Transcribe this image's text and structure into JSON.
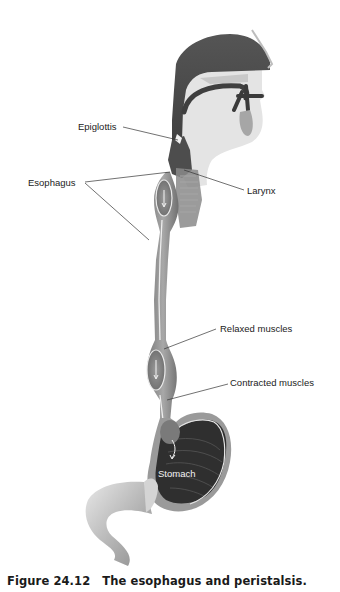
{
  "figure": {
    "labels": {
      "epiglottis": "Epiglottis",
      "esophagus": "Esophagus",
      "larynx": "Larynx",
      "relaxed_muscles": "Relaxed muscles",
      "contracted_muscles": "Contracted muscles",
      "stomach": "Stomach"
    },
    "caption": {
      "number": "Figure 24.12",
      "title": "The esophagus and peristalsis."
    }
  },
  "colors": {
    "dark_tissue": "#4a4a4a",
    "mid_tissue": "#8c8c8c",
    "light_tissue": "#d9d9d9",
    "stomach_interior": "#2e2e2e",
    "label_text": "#222222"
  }
}
